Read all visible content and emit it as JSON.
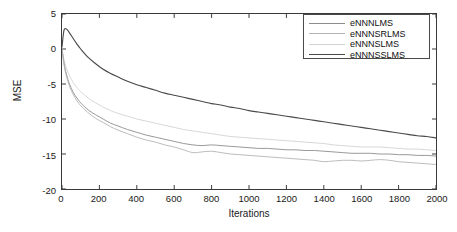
{
  "chart_data": {
    "type": "line",
    "title": "",
    "xlabel": "Iterations",
    "ylabel": "MSE",
    "xlim": [
      0,
      2000
    ],
    "ylim": [
      -20,
      5
    ],
    "xticks": [
      0,
      200,
      400,
      600,
      800,
      1000,
      1200,
      1400,
      1600,
      1800,
      2000
    ],
    "yticks": [
      5,
      0,
      -5,
      -10,
      -15,
      -20
    ],
    "grid": false,
    "legend_position": "top-right",
    "x": [
      0,
      10,
      20,
      30,
      40,
      60,
      80,
      100,
      140,
      180,
      220,
      260,
      300,
      350,
      400,
      450,
      500,
      550,
      600,
      650,
      700,
      750,
      800,
      850,
      900,
      950,
      1000,
      1050,
      1100,
      1150,
      1200,
      1250,
      1300,
      1350,
      1400,
      1450,
      1500,
      1550,
      1600,
      1650,
      1700,
      1750,
      1800,
      1850,
      1900,
      1950,
      2000
    ],
    "series": [
      {
        "name": "eNNNLMS",
        "color": "#8c8c8c",
        "values": [
          0.0,
          -1.9,
          -3.2,
          -4.2,
          -5.0,
          -6.2,
          -7.0,
          -7.7,
          -8.7,
          -9.4,
          -10.0,
          -10.6,
          -11.0,
          -11.5,
          -11.9,
          -12.3,
          -12.6,
          -12.9,
          -13.2,
          -13.5,
          -13.7,
          -13.8,
          -13.7,
          -13.8,
          -13.9,
          -14.0,
          -14.1,
          -14.2,
          -14.2,
          -14.3,
          -14.4,
          -14.4,
          -14.5,
          -14.5,
          -14.6,
          -14.7,
          -14.8,
          -14.9,
          -14.9,
          -14.9,
          -15.0,
          -15.0,
          -15.1,
          -15.1,
          -15.2,
          -15.2,
          -15.3
        ]
      },
      {
        "name": "eNNNSRLMS",
        "color": "#b4b4b4",
        "values": [
          0.0,
          -2.1,
          -3.5,
          -4.5,
          -5.3,
          -6.5,
          -7.4,
          -8.1,
          -9.1,
          -9.9,
          -10.5,
          -11.1,
          -11.6,
          -12.1,
          -12.6,
          -13.0,
          -13.3,
          -13.7,
          -14.0,
          -14.4,
          -14.8,
          -14.7,
          -14.6,
          -14.8,
          -15.0,
          -15.1,
          -15.2,
          -15.3,
          -15.4,
          -15.5,
          -15.6,
          -15.7,
          -15.8,
          -15.9,
          -16.1,
          -16.0,
          -15.9,
          -15.9,
          -16.0,
          -15.9,
          -15.8,
          -15.9,
          -16.1,
          -16.2,
          -16.3,
          -16.4,
          -16.5
        ]
      },
      {
        "name": "eNNNSLMS",
        "color": "#d2d2d2",
        "values": [
          0.0,
          -1.4,
          -2.4,
          -3.2,
          -3.8,
          -4.8,
          -5.5,
          -6.1,
          -7.0,
          -7.7,
          -8.3,
          -8.8,
          -9.2,
          -9.6,
          -10.0,
          -10.3,
          -10.6,
          -10.9,
          -11.2,
          -11.5,
          -11.7,
          -11.9,
          -12.1,
          -12.3,
          -12.5,
          -12.6,
          -12.7,
          -12.8,
          -12.9,
          -13.0,
          -13.1,
          -13.2,
          -13.3,
          -13.4,
          -13.5,
          -13.7,
          -13.8,
          -13.9,
          -14.0,
          -14.0,
          -14.0,
          -14.1,
          -14.2,
          -14.3,
          -14.3,
          -14.4,
          -14.5
        ]
      },
      {
        "name": "eNNNSSLMS",
        "color": "#4a4a4a",
        "values": [
          0.3,
          2.6,
          2.9,
          2.7,
          2.3,
          1.5,
          0.7,
          0.0,
          -1.2,
          -2.1,
          -2.9,
          -3.5,
          -4.0,
          -4.6,
          -5.1,
          -5.5,
          -5.9,
          -6.3,
          -6.6,
          -6.9,
          -7.2,
          -7.5,
          -7.8,
          -8.0,
          -8.3,
          -8.5,
          -8.8,
          -9.0,
          -9.2,
          -9.4,
          -9.6,
          -9.8,
          -10.0,
          -10.2,
          -10.4,
          -10.6,
          -10.8,
          -11.0,
          -11.2,
          -11.4,
          -11.6,
          -11.8,
          -12.0,
          -12.2,
          -12.4,
          -12.5,
          -12.7
        ]
      }
    ]
  },
  "axes": {
    "y_title": "MSE",
    "x_title": "Iterations",
    "ytick_labels": [
      "5",
      "0",
      "-5",
      "-10",
      "-15",
      "-20"
    ],
    "xtick_labels": [
      "0",
      "200",
      "400",
      "600",
      "800",
      "1000",
      "1200",
      "1400",
      "1600",
      "1800",
      "2000"
    ]
  },
  "legend": {
    "entries": [
      {
        "label": "eNNNLMS"
      },
      {
        "label": "eNNNSRLMS"
      },
      {
        "label": "eNNNSLMS"
      },
      {
        "label": "eNNNSSLMS"
      }
    ]
  },
  "colors": {
    "background": "#ffffff",
    "axis": "#3a3a3a",
    "text": "#1a1a1a"
  }
}
